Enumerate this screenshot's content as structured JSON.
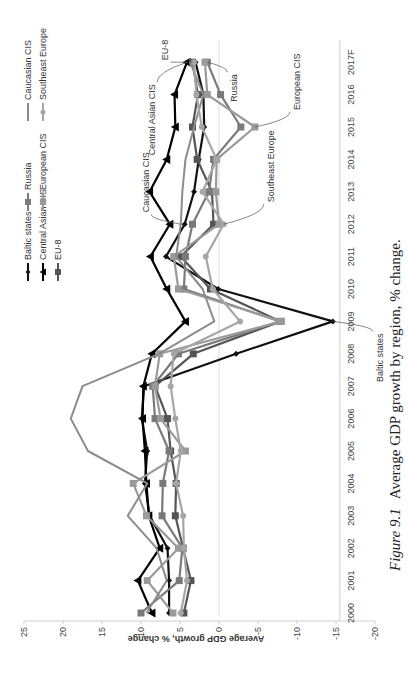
{
  "caption": {
    "label": "Figure 9.1",
    "text": "Average GDP growth by region, % change."
  },
  "chart_data": {
    "type": "line",
    "title": "Average GDP growth by region, % change",
    "xlabel": "",
    "ylabel": "Average GDP growth, % change",
    "ylim": [
      -20,
      25
    ],
    "yticks": [
      25,
      20,
      15,
      10,
      5,
      0,
      -5,
      -10,
      -15,
      -20
    ],
    "grid": false,
    "legend_position": "top",
    "categories": [
      "2000",
      "2001",
      "2002",
      "2003",
      "2004",
      "2005",
      "2006",
      "2007",
      "2008",
      "2009",
      "2010",
      "2011",
      "2012",
      "2013",
      "2014",
      "2015",
      "2016",
      "2017F"
    ],
    "series": [
      {
        "name": "Baltic states",
        "color": "#111111",
        "marker": "diamond",
        "values": [
          6.4,
          6.4,
          6.6,
          8.9,
          9.5,
          9.2,
          9.9,
          9.6,
          -2.2,
          -14.6,
          0.1,
          6.8,
          4.4,
          3.2,
          2.6,
          1.9,
          2.0,
          3.0
        ]
      },
      {
        "name": "Central Asian CIS",
        "color": "#000000",
        "marker": "triangle",
        "values": [
          8.6,
          10.4,
          7.6,
          9.0,
          9.3,
          9.5,
          9.8,
          9.7,
          8.6,
          4.3,
          6.7,
          8.8,
          6.3,
          8.9,
          6.7,
          5.6,
          5.7,
          4.1
        ]
      },
      {
        "name": "EU-8",
        "color": "#555555",
        "marker": "square",
        "values": [
          4.5,
          3.6,
          4.6,
          5.6,
          5.5,
          6.2,
          6.6,
          8.2,
          3.3,
          -7.9,
          1.1,
          4.9,
          0.7,
          0.9,
          2.8,
          3.4,
          2.7,
          3.4
        ]
      },
      {
        "name": "Russia",
        "color": "#7a7a7a",
        "marker": "square",
        "values": [
          10.0,
          5.1,
          4.7,
          7.3,
          7.2,
          6.4,
          8.2,
          8.5,
          5.2,
          -7.8,
          4.5,
          4.3,
          3.4,
          1.3,
          0.7,
          -2.8,
          -0.2,
          1.5
        ]
      },
      {
        "name": "European CIS",
        "color": "#9a9a9a",
        "marker": "square",
        "values": [
          5.9,
          9.2,
          5.2,
          9.3,
          11.0,
          4.3,
          7.5,
          8.2,
          7.6,
          -8.0,
          5.2,
          5.8,
          0.0,
          0.4,
          0.3,
          -4.6,
          1.5,
          1.8
        ]
      },
      {
        "name": "Caucasian CIS",
        "color": "#8c8c8c",
        "marker": "none",
        "values": [
          9.3,
          6.7,
          8.0,
          11.7,
          9.2,
          16.8,
          19.0,
          17.5,
          7.7,
          0.6,
          2.1,
          5.5,
          4.9,
          4.7,
          4.3,
          3.2,
          2.0,
          3.7
        ]
      },
      {
        "name": "Southeast Europe",
        "color": "#a6a6a6",
        "marker": "circle",
        "values": [
          4.9,
          4.1,
          4.5,
          4.6,
          5.5,
          4.9,
          5.6,
          6.2,
          5.8,
          -2.7,
          0.8,
          1.7,
          -0.6,
          2.1,
          0.3,
          2.2,
          2.9,
          3.2
        ]
      }
    ],
    "annotations": [
      {
        "text": "Baltic states",
        "year": "2009"
      },
      {
        "text": "Caucasian CIS",
        "year": "2012"
      },
      {
        "text": "Southeast Europe",
        "year": "2012"
      },
      {
        "text": "European CIS",
        "year": "2015"
      },
      {
        "text": "Central Asian CIS",
        "year": "2017F"
      },
      {
        "text": "EU-8",
        "year": "2017F"
      },
      {
        "text": "Russia",
        "year": "2017F"
      }
    ]
  }
}
